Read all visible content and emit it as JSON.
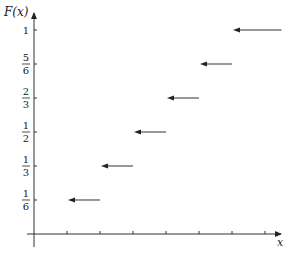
{
  "chart_data": {
    "type": "line",
    "subtype": "step-function-cdf",
    "title": "",
    "xlabel": "x",
    "ylabel": "F(x)",
    "y_tick_labels": [
      {
        "num": "1",
        "den": "6",
        "value": 0.1667
      },
      {
        "num": "1",
        "den": "3",
        "value": 0.3333
      },
      {
        "num": "1",
        "den": "2",
        "value": 0.5
      },
      {
        "num": "2",
        "den": "3",
        "value": 0.6667
      },
      {
        "num": "5",
        "den": "6",
        "value": 0.8333
      },
      {
        "num": "1",
        "den": "",
        "value": 1
      }
    ],
    "x_ticks": [
      1,
      2,
      3,
      4,
      5,
      6,
      7
    ],
    "x_tick_labels_shown": false,
    "grid": false,
    "legend": null,
    "segments": [
      {
        "x_start": 1,
        "x_end": 2,
        "y": 0.1667,
        "arrowhead": "left"
      },
      {
        "x_start": 2,
        "x_end": 3,
        "y": 0.3333,
        "arrowhead": "left"
      },
      {
        "x_start": 3,
        "x_end": 4,
        "y": 0.5,
        "arrowhead": "left"
      },
      {
        "x_start": 4,
        "x_end": 5,
        "y": 0.6667,
        "arrowhead": "left"
      },
      {
        "x_start": 5,
        "x_end": 6,
        "y": 0.8333,
        "arrowhead": "left"
      },
      {
        "x_start": 6,
        "x_end": 7.5,
        "y": 1,
        "arrowhead": "left"
      }
    ],
    "xlim": [
      0,
      7.5
    ],
    "ylim": [
      0,
      1.1
    ]
  },
  "labels": {
    "y_axis": "F(x)",
    "x_axis": "x"
  },
  "colors": {
    "axis": "#333333",
    "segment": "#333333",
    "background": "#ffffff"
  }
}
